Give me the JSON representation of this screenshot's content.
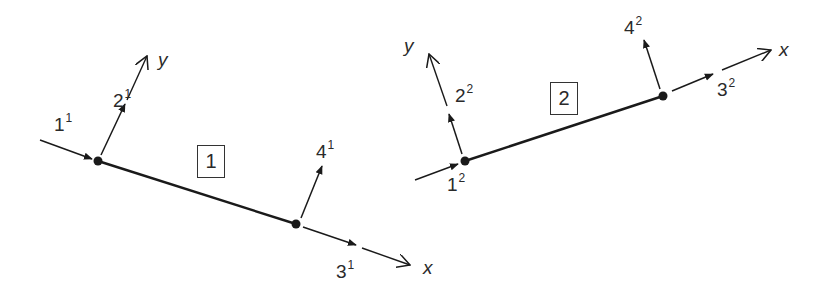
{
  "figure": {
    "colors": {
      "line": "#1a1a1a",
      "text": "#2a2a2a",
      "background": "#ffffff"
    }
  },
  "element1": {
    "id": "1",
    "axes": {
      "x": "x",
      "y": "y"
    },
    "dofs": [
      {
        "num": "1",
        "sup": "1"
      },
      {
        "num": "2",
        "sup": "1"
      },
      {
        "num": "3",
        "sup": "1"
      },
      {
        "num": "4",
        "sup": "1"
      }
    ]
  },
  "element2": {
    "id": "2",
    "axes": {
      "x": "x",
      "y": "y"
    },
    "dofs": [
      {
        "num": "1",
        "sup": "2"
      },
      {
        "num": "2",
        "sup": "2"
      },
      {
        "num": "3",
        "sup": "2"
      },
      {
        "num": "4",
        "sup": "2"
      }
    ]
  }
}
